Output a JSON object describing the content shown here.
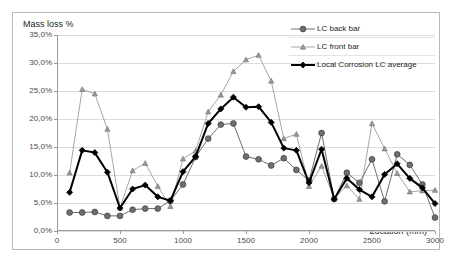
{
  "caption_remnant": "",
  "chart_data": {
    "type": "line",
    "title": "",
    "xlabel": "Location (mm)",
    "ylabel": "Mass loss %",
    "xlim": [
      0,
      3000
    ],
    "ylim": [
      0,
      35
    ],
    "grid": "horizontal",
    "legend_position": "inside-top-right",
    "y_tick_labels": [
      "0,0%",
      "5,0%",
      "10,0%",
      "15,0%",
      "20,0%",
      "25,0%",
      "30,0%",
      "35,0%"
    ],
    "y_tick_values": [
      0,
      5,
      10,
      15,
      20,
      25,
      30,
      35
    ],
    "x_tick_labels": [
      "0",
      "500",
      "1000",
      "1500",
      "2000",
      "2500",
      "3000"
    ],
    "x_tick_values": [
      0,
      500,
      1000,
      1500,
      2000,
      2500,
      3000
    ],
    "x": [
      100,
      200,
      300,
      400,
      500,
      600,
      700,
      800,
      900,
      1000,
      1100,
      1200,
      1300,
      1400,
      1500,
      1600,
      1700,
      1800,
      1900,
      2000,
      2100,
      2200,
      2300,
      2400,
      2500,
      2600,
      2700,
      2800,
      2900,
      3000
    ],
    "series": [
      {
        "name": "LC back bar",
        "marker": "circle",
        "color": "#6e6e6e",
        "line_width": 1,
        "values": [
          3.3,
          3.3,
          3.4,
          2.7,
          2.7,
          3.8,
          4.0,
          4.0,
          5.4,
          8.3,
          13.2,
          16.5,
          19.0,
          19.2,
          13.3,
          12.8,
          11.7,
          13.0,
          10.9,
          9.0,
          17.5,
          5.7,
          10.4,
          8.6,
          12.8,
          5.3,
          13.7,
          11.8,
          8.3,
          2.4
        ]
      },
      {
        "name": "LC front bar",
        "marker": "triangle",
        "color": "#8f8f8f",
        "line_width": 0.8,
        "values": [
          10.4,
          25.3,
          24.5,
          18.2,
          4.1,
          10.8,
          12.1,
          8.0,
          4.4,
          12.9,
          14.3,
          21.3,
          24.3,
          28.5,
          30.6,
          31.4,
          26.8,
          16.5,
          17.3,
          8.0,
          11.6,
          5.8,
          8.1,
          5.7,
          19.2,
          14.7,
          10.3,
          7.0,
          7.2,
          7.3
        ]
      },
      {
        "name": "Local Corrosion LC average",
        "marker": "diamond",
        "color": "#000000",
        "line_width": 2,
        "values": [
          6.9,
          14.4,
          14.0,
          10.5,
          4.1,
          7.5,
          8.2,
          6.1,
          5.4,
          10.6,
          13.3,
          19.2,
          21.8,
          23.9,
          22.1,
          22.2,
          19.4,
          14.8,
          14.4,
          8.6,
          14.6,
          5.7,
          9.4,
          7.4,
          6.1,
          10.1,
          12.0,
          9.4,
          7.7,
          4.9
        ]
      }
    ]
  }
}
